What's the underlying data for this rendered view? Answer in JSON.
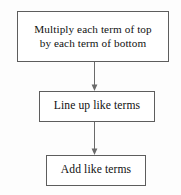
{
  "diagram": {
    "type": "flowchart",
    "orientation": "vertical",
    "background_color": "#fdfdfd",
    "border_color": "#5d5d5d",
    "connector_color": "#6a6a6a",
    "text_color": "#111111",
    "nodes": [
      {
        "id": "multiply",
        "label": "Multiply each term of top\nby each term of bottom",
        "line1": "Multiply each term of top",
        "line2": "by each term of bottom",
        "shape": "rectangle"
      },
      {
        "id": "lineup",
        "label": "Line up like terms",
        "shape": "rectangle"
      },
      {
        "id": "add",
        "label": "Add like terms",
        "shape": "rectangle"
      }
    ],
    "connectors": [
      {
        "id": "multiply-to-lineup",
        "from": "multiply",
        "to": "lineup",
        "arrowhead": "down"
      },
      {
        "id": "lineup-to-add",
        "from": "lineup",
        "to": "add",
        "arrowhead": "down"
      }
    ]
  }
}
